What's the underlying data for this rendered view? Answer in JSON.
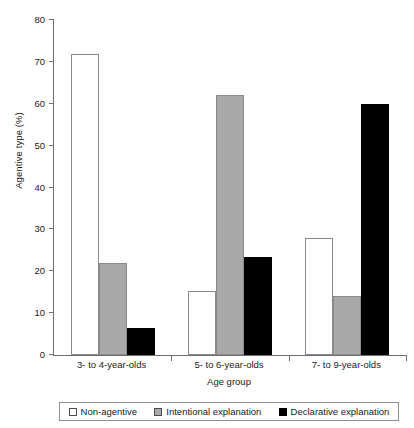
{
  "chart_data": {
    "type": "bar",
    "title": "",
    "xlabel": "Age group",
    "ylabel": "Agentive type (%)",
    "categories": [
      "3- to 4-year-olds",
      "5- to 6-year-olds",
      "7- to 9-year-olds"
    ],
    "series": [
      {
        "name": "Non-agentive",
        "color": "#ffffff",
        "values": [
          72,
          15.3,
          28
        ]
      },
      {
        "name": "Intentional explanation",
        "color": "#a9a9a9",
        "values": [
          22,
          62,
          14
        ]
      },
      {
        "name": "Declarative explanation",
        "color": "#000000",
        "values": [
          6.5,
          23.5,
          60
        ]
      }
    ],
    "ylim": [
      0,
      80
    ],
    "yticks": [
      0,
      10,
      20,
      30,
      40,
      50,
      60,
      70,
      80
    ],
    "ytick_labels": [
      "0",
      "10",
      "20",
      "30",
      "40",
      "50",
      "60",
      "70",
      "80"
    ],
    "grid": false,
    "legend_position": "bottom"
  },
  "axes": {
    "y_title": "Agentive type (%)",
    "x_title": "Age group",
    "y_labels": [
      "80",
      "70",
      "60",
      "50",
      "40",
      "30",
      "20",
      "10",
      "0"
    ],
    "x_labels": [
      "3- to 4-year-olds",
      "5- to 6-year-olds",
      "7- to 9-year-olds"
    ]
  },
  "legend": {
    "items": [
      {
        "label": "Non-agentive",
        "swatch": "white"
      },
      {
        "label": "Intentional explanation",
        "swatch": "gray"
      },
      {
        "label": "Declarative explanation",
        "swatch": "black"
      }
    ]
  },
  "colors": {
    "axis": "#6f6f6f",
    "bar_outline": "#8a8a8a",
    "gray_fill": "#a9a9a9",
    "black_fill": "#000000",
    "background": "#ffffff"
  }
}
